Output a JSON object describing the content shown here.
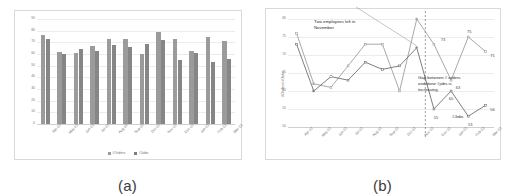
{
  "figure": {
    "panel_a_caption": "(a)",
    "panel_b_caption": "(b)"
  },
  "chart_data": [
    {
      "id": "panel-a",
      "type": "bar",
      "title": "",
      "xlabel": "",
      "ylabel": "",
      "ylim": [
        0,
        90
      ],
      "yticks": [
        0,
        10,
        20,
        30,
        40,
        50,
        60,
        70,
        80,
        90
      ],
      "grid": true,
      "legend_position": "bottom",
      "categories": [
        "Apr-22",
        "May-22",
        "Jun-22",
        "Jul-22",
        "Aug-22",
        "Sep-22",
        "Oct-22",
        "Nov-22",
        "Dec-22",
        "Jan-23",
        "Feb-23",
        "Mar-23"
      ],
      "series": [
        {
          "name": "#Orders",
          "color": "#9b9b9b",
          "values": [
            76,
            62,
            61,
            67,
            73,
            73,
            60,
            79,
            73,
            63,
            75,
            71
          ]
        },
        {
          "name": "#Jobs",
          "color": "#868686",
          "values": [
            73,
            60,
            64,
            63,
            68,
            66,
            69,
            72,
            55,
            61,
            53,
            56
          ]
        }
      ]
    },
    {
      "id": "panel-b",
      "type": "line",
      "title": "",
      "xlabel": "",
      "ylabel": "#Orders/#Jobs",
      "ylim": [
        50,
        80
      ],
      "yticks": [
        50,
        55,
        60,
        65,
        70,
        75,
        80
      ],
      "grid": true,
      "legend_position": "none",
      "x": [
        "Apr-22",
        "May-22",
        "Jun-22",
        "Jul-22",
        "Aug-22",
        "Sep-22",
        "Oct-22",
        "Nov-22",
        "Dec-22",
        "Jan-23",
        "Feb-23",
        "Mar-23"
      ],
      "series": [
        {
          "name": "#Orders",
          "color": "#9e9e9e",
          "values": [
            76,
            62,
            61,
            67,
            73,
            73,
            60,
            80,
            73,
            63,
            75,
            71
          ]
        },
        {
          "name": "#Jobs",
          "color": "#6f6f6f",
          "values": [
            73,
            60,
            64,
            63,
            68,
            66,
            67,
            72,
            55,
            60,
            53,
            56
          ]
        }
      ],
      "data_labels": [
        {
          "series": "#Orders",
          "x": "Dec-22",
          "value": "73"
        },
        {
          "series": "#Orders",
          "x": "Jan-23",
          "value": "63"
        },
        {
          "series": "#Orders",
          "x": "Feb-23",
          "value": "75"
        },
        {
          "series": "#Orders",
          "x": "Mar-23",
          "value": "71"
        },
        {
          "series": "#Jobs",
          "x": "Dec-22",
          "value": "55"
        },
        {
          "series": "#Jobs",
          "x": "Jan-23",
          "value": "60"
        },
        {
          "series": "#Jobs",
          "x": "Feb-23",
          "value": "53"
        },
        {
          "series": "#Jobs",
          "x": "Mar-23",
          "value": "56"
        }
      ],
      "annotations": [
        {
          "id": "annot-employees",
          "text": "Two employees left in\nNovember."
        },
        {
          "id": "annot-gap",
          "text": "Gap between # orders\nand done #jobs is\nincreasing."
        },
        {
          "id": "annot-jobs-series",
          "text": "#Jobs"
        }
      ],
      "marker_line": {
        "id": "november-divider",
        "at": "Nov-22",
        "style": "dashed"
      }
    }
  ]
}
